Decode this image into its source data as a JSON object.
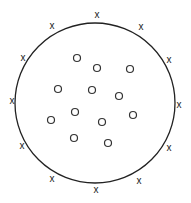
{
  "diagram": {
    "boundary": {
      "cx": 95,
      "cy": 103,
      "r": 80,
      "stroke": "#222222"
    },
    "outer_marks": {
      "glyph": "x",
      "points": [
        {
          "x": 97,
          "y": 14
        },
        {
          "x": 52,
          "y": 25
        },
        {
          "x": 141,
          "y": 26
        },
        {
          "x": 23,
          "y": 57
        },
        {
          "x": 169,
          "y": 59
        },
        {
          "x": 12,
          "y": 100
        },
        {
          "x": 179,
          "y": 104
        },
        {
          "x": 22,
          "y": 145
        },
        {
          "x": 169,
          "y": 147
        },
        {
          "x": 52,
          "y": 178
        },
        {
          "x": 139,
          "y": 180
        },
        {
          "x": 96,
          "y": 189
        }
      ]
    },
    "inner_marks": {
      "glyph": "o",
      "r": 3.5,
      "points": [
        {
          "x": 77,
          "y": 58
        },
        {
          "x": 97,
          "y": 68
        },
        {
          "x": 130,
          "y": 69
        },
        {
          "x": 58,
          "y": 89
        },
        {
          "x": 92,
          "y": 90
        },
        {
          "x": 119,
          "y": 96
        },
        {
          "x": 75,
          "y": 112
        },
        {
          "x": 133,
          "y": 115
        },
        {
          "x": 51,
          "y": 120
        },
        {
          "x": 102,
          "y": 122
        },
        {
          "x": 74,
          "y": 138
        },
        {
          "x": 108,
          "y": 143
        }
      ]
    }
  }
}
